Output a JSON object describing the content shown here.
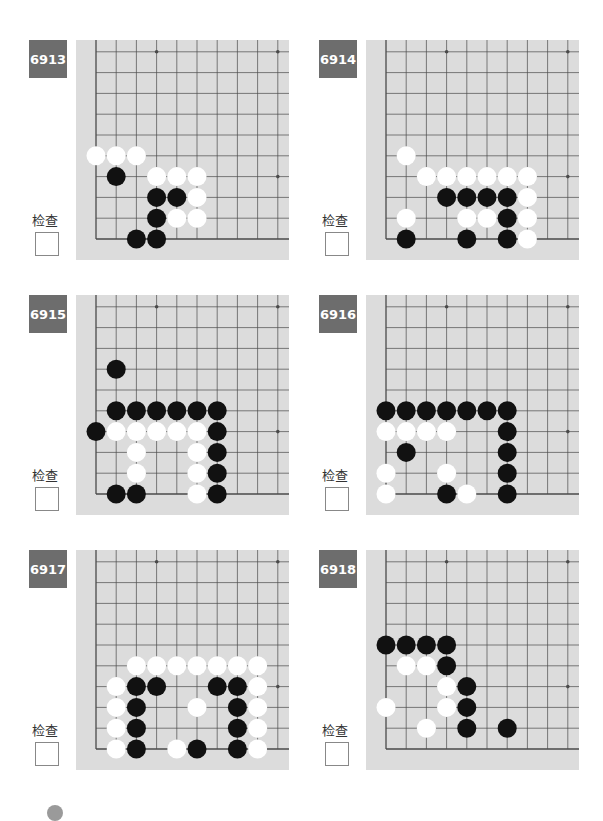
{
  "page": {
    "check_label": "检查"
  },
  "colors": {
    "tag_bg": "#6d6d6d",
    "board_bg": "#dcdcdc",
    "grid_line": "#4a4a4a",
    "black_stone": "#111111",
    "white_stone": "#ffffff"
  },
  "board_geometry": {
    "spacing_x": 20.2,
    "spacing_y": 20.8,
    "origin_x": 20,
    "bottom_y": 199,
    "stone_radius": 9.5,
    "columns_visible": 10,
    "rows_visible": 10,
    "star_points": [
      [
        3,
        3
      ],
      [
        9,
        3
      ],
      [
        3,
        9
      ],
      [
        9,
        9
      ]
    ]
  },
  "problems": [
    {
      "id": "6913",
      "stones": {
        "black": [
          [
            1,
            3
          ],
          [
            3,
            2
          ],
          [
            4,
            2
          ],
          [
            3,
            1
          ],
          [
            2,
            0
          ],
          [
            3,
            0
          ]
        ],
        "white": [
          [
            0,
            4
          ],
          [
            1,
            4
          ],
          [
            2,
            4
          ],
          [
            3,
            3
          ],
          [
            4,
            3
          ],
          [
            5,
            3
          ],
          [
            5,
            2
          ],
          [
            4,
            1
          ],
          [
            5,
            1
          ]
        ]
      }
    },
    {
      "id": "6914",
      "stones": {
        "black": [
          [
            3,
            2
          ],
          [
            4,
            2
          ],
          [
            5,
            2
          ],
          [
            6,
            2
          ],
          [
            6,
            1
          ],
          [
            1,
            0
          ],
          [
            4,
            0
          ],
          [
            6,
            0
          ]
        ],
        "white": [
          [
            1,
            4
          ],
          [
            2,
            3
          ],
          [
            3,
            3
          ],
          [
            4,
            3
          ],
          [
            5,
            3
          ],
          [
            6,
            3
          ],
          [
            7,
            3
          ],
          [
            7,
            2
          ],
          [
            1,
            1
          ],
          [
            4,
            1
          ],
          [
            5,
            1
          ],
          [
            7,
            1
          ],
          [
            7,
            0
          ]
        ]
      }
    },
    {
      "id": "6915",
      "stones": {
        "black": [
          [
            1,
            6
          ],
          [
            1,
            4
          ],
          [
            2,
            4
          ],
          [
            3,
            4
          ],
          [
            4,
            4
          ],
          [
            5,
            4
          ],
          [
            6,
            4
          ],
          [
            0,
            3
          ],
          [
            6,
            3
          ],
          [
            6,
            2
          ],
          [
            6,
            1
          ],
          [
            1,
            0
          ],
          [
            2,
            0
          ],
          [
            6,
            0
          ]
        ],
        "white": [
          [
            1,
            3
          ],
          [
            2,
            3
          ],
          [
            3,
            3
          ],
          [
            4,
            3
          ],
          [
            5,
            3
          ],
          [
            2,
            2
          ],
          [
            5,
            2
          ],
          [
            2,
            1
          ],
          [
            5,
            1
          ],
          [
            5,
            0
          ]
        ]
      }
    },
    {
      "id": "6916",
      "stones": {
        "black": [
          [
            0,
            4
          ],
          [
            1,
            4
          ],
          [
            2,
            4
          ],
          [
            3,
            4
          ],
          [
            4,
            4
          ],
          [
            5,
            4
          ],
          [
            6,
            4
          ],
          [
            6,
            3
          ],
          [
            1,
            2
          ],
          [
            6,
            2
          ],
          [
            6,
            1
          ],
          [
            3,
            0
          ],
          [
            6,
            0
          ]
        ],
        "white": [
          [
            0,
            3
          ],
          [
            1,
            3
          ],
          [
            2,
            3
          ],
          [
            3,
            3
          ],
          [
            0,
            1
          ],
          [
            3,
            1
          ],
          [
            0,
            0
          ],
          [
            4,
            0
          ]
        ]
      }
    },
    {
      "id": "6917",
      "stones": {
        "black": [
          [
            2,
            3
          ],
          [
            3,
            3
          ],
          [
            6,
            3
          ],
          [
            7,
            3
          ],
          [
            2,
            2
          ],
          [
            7,
            2
          ],
          [
            2,
            1
          ],
          [
            7,
            1
          ],
          [
            2,
            0
          ],
          [
            5,
            0
          ],
          [
            7,
            0
          ]
        ],
        "white": [
          [
            2,
            4
          ],
          [
            3,
            4
          ],
          [
            4,
            4
          ],
          [
            5,
            4
          ],
          [
            6,
            4
          ],
          [
            7,
            4
          ],
          [
            8,
            4
          ],
          [
            1,
            3
          ],
          [
            8,
            3
          ],
          [
            1,
            2
          ],
          [
            5,
            2
          ],
          [
            8,
            2
          ],
          [
            1,
            1
          ],
          [
            8,
            1
          ],
          [
            1,
            0
          ],
          [
            4,
            0
          ],
          [
            8,
            0
          ]
        ]
      }
    },
    {
      "id": "6918",
      "stones": {
        "black": [
          [
            0,
            5
          ],
          [
            1,
            5
          ],
          [
            2,
            5
          ],
          [
            3,
            5
          ],
          [
            3,
            4
          ],
          [
            4,
            3
          ],
          [
            4,
            2
          ],
          [
            4,
            1
          ],
          [
            6,
            1
          ]
        ],
        "white": [
          [
            1,
            4
          ],
          [
            2,
            4
          ],
          [
            3,
            3
          ],
          [
            0,
            2
          ],
          [
            3,
            2
          ],
          [
            2,
            1
          ]
        ]
      }
    }
  ]
}
